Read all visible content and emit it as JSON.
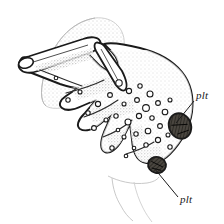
{
  "figure": {
    "kind": "scientific-line-drawing",
    "background_color": "#ffffff",
    "ink_color": "#1a1a1a",
    "stipple_color": "#8a8a8a",
    "shade_color": "#6b6b6b",
    "pigment_fill_color": "#3d3a36",
    "ghost_outline_color": "#c9c9c9"
  },
  "labels": [
    {
      "id": "plt-upper",
      "text": "plt",
      "text_x": 196,
      "text_y": 99,
      "leader": {
        "x1": 194,
        "y1": 101,
        "x2": 176,
        "y2": 123
      }
    },
    {
      "id": "plt-lower",
      "text": "plt",
      "text_x": 180,
      "text_y": 203,
      "leader": {
        "x1": 178,
        "y1": 197,
        "x2": 154,
        "y2": 168
      }
    }
  ],
  "structures": {
    "ghost_dome": {
      "name": "stippled background dome",
      "path": "M 95 18 C 70 22 53 44 46 68 C 40 88 40 101 46 106 C 56 112 76 106 92 94 C 110 80 122 62 124 46 C 126 30 114 16 95 18 Z"
    },
    "ghost_skirt": {
      "name": "faint lower outline",
      "path": "M 108 178 C 118 182 132 185 146 183 C 152 182 156 180 158 177 M 120 182 C 124 192 128 200 134 208 C 138 214 142 218 146 222"
    },
    "main_body": {
      "name": "main spiculate body outline",
      "path": "M 22 58 C 18 62 19 67 24 70 L 60 84 C 66 86 72 88 78 88 L 66 96 C 60 100 58 105 62 108 C 66 111 74 110 82 106 L 96 100 L 84 114 C 78 120 76 126 80 129 C 85 132 93 130 100 124 L 112 114 L 104 132 C 100 142 100 150 105 152 C 110 154 117 149 122 140 L 130 124 L 132 140 C 133 152 137 160 143 162 C 152 165 162 162 170 154 C 182 142 190 126 192 112 C 194 96 190 82 182 72 C 172 60 156 52 140 48 C 124 44 112 42 104 44 L 112 52 C 118 58 120 66 117 70 C 114 74 107 72 100 66 L 86 52 C 80 46 74 44 70 46 L 60 58 C 54 64 48 66 42 64 L 28 58 C 25 57 23 57 22 58 Z"
    },
    "long_process": {
      "name": "elongated blunt-tipped process",
      "path": "M 24 58 C 19 60 17 65 20 69 C 23 73 30 74 38 71 L 92 52 C 99 49 102 45 100 41 C 98 37 91 36 83 39 L 30 56 C 27 57 25 57 24 58 Z"
    },
    "top_spine": {
      "name": "upper pointed spine",
      "path": "M 100 44 C 96 42 94 45 96 51 L 112 78 C 116 86 121 90 124 88 C 127 86 126 79 122 71 L 106 48 C 104 45 102 44 100 44 Z"
    },
    "pigment_plates": [
      {
        "id": "plate-upper",
        "cx": 180,
        "cy": 126,
        "rx": 11,
        "ry": 13,
        "rotate": -22
      },
      {
        "id": "plate-lower",
        "cx": 157,
        "cy": 165,
        "rx": 9,
        "ry": 8,
        "rotate": 12
      }
    ],
    "vacuoles": [
      {
        "cx": 119,
        "cy": 83,
        "r": 3.2
      },
      {
        "cx": 129,
        "cy": 91,
        "r": 2.6
      },
      {
        "cx": 140,
        "cy": 86,
        "r": 2.2
      },
      {
        "cx": 150,
        "cy": 94,
        "r": 3.0
      },
      {
        "cx": 137,
        "cy": 100,
        "r": 2.4
      },
      {
        "cx": 124,
        "cy": 104,
        "r": 2.0
      },
      {
        "cx": 146,
        "cy": 108,
        "r": 3.4
      },
      {
        "cx": 158,
        "cy": 103,
        "r": 2.4
      },
      {
        "cx": 165,
        "cy": 112,
        "r": 2.8
      },
      {
        "cx": 152,
        "cy": 118,
        "r": 2.2
      },
      {
        "cx": 139,
        "cy": 116,
        "r": 2.6
      },
      {
        "cx": 128,
        "cy": 122,
        "r": 3.0
      },
      {
        "cx": 116,
        "cy": 116,
        "r": 2.2
      },
      {
        "cx": 160,
        "cy": 126,
        "r": 2.4
      },
      {
        "cx": 170,
        "cy": 100,
        "r": 2.0
      },
      {
        "cx": 148,
        "cy": 131,
        "r": 2.8
      },
      {
        "cx": 136,
        "cy": 134,
        "r": 2.2
      },
      {
        "cx": 124,
        "cy": 137,
        "r": 2.0
      },
      {
        "cx": 158,
        "cy": 140,
        "r": 2.6
      },
      {
        "cx": 168,
        "cy": 135,
        "r": 2.0
      },
      {
        "cx": 146,
        "cy": 145,
        "r": 2.2
      },
      {
        "cx": 134,
        "cy": 148,
        "r": 1.8
      },
      {
        "cx": 170,
        "cy": 147,
        "r": 2.2
      },
      {
        "cx": 110,
        "cy": 95,
        "r": 2.4
      },
      {
        "cx": 98,
        "cy": 104,
        "r": 2.6
      },
      {
        "cx": 88,
        "cy": 113,
        "r": 2.2
      },
      {
        "cx": 106,
        "cy": 120,
        "r": 2.0
      },
      {
        "cx": 94,
        "cy": 128,
        "r": 2.4
      },
      {
        "cx": 118,
        "cy": 130,
        "r": 1.8
      },
      {
        "cx": 80,
        "cy": 92,
        "r": 2.0
      },
      {
        "cx": 68,
        "cy": 100,
        "r": 2.2
      },
      {
        "cx": 56,
        "cy": 78,
        "r": 1.8
      },
      {
        "cx": 112,
        "cy": 148,
        "r": 2.2
      },
      {
        "cx": 126,
        "cy": 156,
        "r": 1.8
      }
    ]
  }
}
